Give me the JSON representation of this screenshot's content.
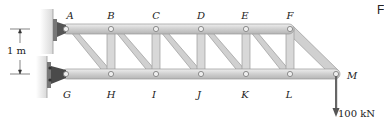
{
  "diagram": {
    "type": "truss",
    "nodes_top": [
      "A",
      "B",
      "C",
      "D",
      "E",
      "F"
    ],
    "nodes_bottom": [
      "G",
      "H",
      "I",
      "J",
      "K",
      "L"
    ],
    "tip_node": "M",
    "labels": {
      "A": "A",
      "B": "B",
      "C": "C",
      "D": "D",
      "E": "E",
      "F": "F",
      "G": "G",
      "H": "H",
      "I": "I",
      "J": "J",
      "K": "K",
      "L": "L",
      "M": "M"
    },
    "dimension_label": "1 m",
    "load_label": "100 kN",
    "corner_fragment": "F",
    "colors": {
      "member_fill": "#d4d4d4",
      "member_edge": "#9a9a9a",
      "wall": "#e0e0e0",
      "support": "#555555",
      "load_arrow": "#666666"
    }
  }
}
